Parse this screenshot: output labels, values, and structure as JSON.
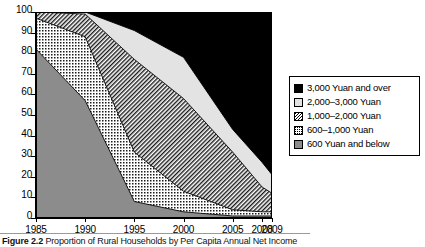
{
  "chart_data": {
    "type": "area",
    "title": "",
    "xlabel": "",
    "ylabel": "",
    "x": [
      1985,
      1990,
      1995,
      2000,
      2005,
      2008,
      2009
    ],
    "xticklabels": [
      "1985",
      "1990",
      "1995",
      "2000",
      "2005",
      "2008",
      "2009"
    ],
    "yticklabels": [
      "0",
      "10",
      "20",
      "30",
      "40",
      "50",
      "60",
      "70",
      "80",
      "90",
      "100"
    ],
    "ylim": [
      0,
      100
    ],
    "yticks": [
      0,
      10,
      20,
      30,
      40,
      50,
      60,
      70,
      80,
      90,
      100
    ],
    "grid": false,
    "stacked": true,
    "legend_position": "right",
    "series": [
      {
        "name": "600 Yuan and below",
        "values": [
          82,
          57,
          8,
          3,
          1,
          1,
          1
        ],
        "color": "#8c8c8c",
        "pattern": "solid-gray"
      },
      {
        "name": "600–1,000 Yuan",
        "values": [
          15,
          31,
          24,
          10,
          3,
          2,
          2
        ],
        "color": "#ffffff",
        "pattern": "dotted"
      },
      {
        "name": "1,000–2,000 Yuan",
        "values": [
          3,
          11,
          45,
          45,
          28,
          12,
          9
        ],
        "color": "#ffffff",
        "pattern": "hatch"
      },
      {
        "name": "2,000–3,000 Yuan",
        "values": [
          0,
          1,
          14,
          20,
          11,
          12,
          9
        ],
        "color": "#e3e3e3",
        "pattern": "light-gray"
      },
      {
        "name": "3,000 Yuan and over",
        "values": [
          0,
          0,
          9,
          22,
          57,
          73,
          79
        ],
        "color": "#000000",
        "pattern": "solid-black"
      }
    ],
    "cumulative_tops": {
      "600 Yuan and below": [
        82,
        57,
        8,
        3,
        1,
        1,
        1
      ],
      "600–1,000 Yuan": [
        97,
        88,
        32,
        13,
        4,
        3,
        3
      ],
      "1,000–2,000 Yuan": [
        100,
        99,
        77,
        58,
        32,
        15,
        12
      ],
      "2,000–3,000 Yuan": [
        100,
        100,
        91,
        78,
        43,
        27,
        21
      ],
      "3,000 Yuan and over": [
        100,
        100,
        100,
        100,
        100,
        100,
        100
      ]
    }
  },
  "legend": {
    "items": [
      {
        "label": "3,000 Yuan and over",
        "swatch": "sw-black"
      },
      {
        "label": "2,000–3,000 Yuan",
        "swatch": "sw-light"
      },
      {
        "label": "1,000–2,000 Yuan",
        "swatch": "sw-hatch"
      },
      {
        "label": "600–1,000 Yuan",
        "swatch": "sw-dot"
      },
      {
        "label": "600 Yuan and below",
        "swatch": "sw-gray"
      }
    ]
  },
  "caption": {
    "label": "Figure 2.2",
    "text": "Proportion of Rural Households by Per Capita Annual Net Income"
  }
}
